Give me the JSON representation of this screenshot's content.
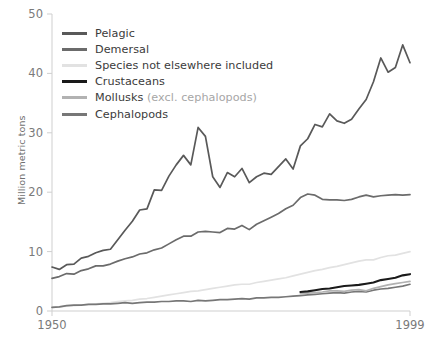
{
  "chart_data": {
    "type": "line",
    "title": "",
    "xlabel": "",
    "ylabel": "Million metric tons",
    "xlim": [
      1950,
      1999
    ],
    "ylim": [
      0,
      50
    ],
    "yticks": [
      0,
      10,
      20,
      30,
      40,
      50
    ],
    "xticks": [
      1950,
      1999
    ],
    "xtick_labels": [
      "1950",
      "1999"
    ],
    "ytick_labels": [
      "0",
      "10",
      "20",
      "30",
      "40",
      "50"
    ],
    "grid": false,
    "legend_position": "upper-left-inside",
    "x": [
      1950,
      1951,
      1952,
      1953,
      1954,
      1955,
      1956,
      1957,
      1958,
      1959,
      1960,
      1961,
      1962,
      1963,
      1964,
      1965,
      1966,
      1967,
      1968,
      1969,
      1970,
      1971,
      1972,
      1973,
      1974,
      1975,
      1976,
      1977,
      1978,
      1979,
      1980,
      1981,
      1982,
      1983,
      1984,
      1985,
      1986,
      1987,
      1988,
      1989,
      1990,
      1991,
      1992,
      1993,
      1994,
      1995,
      1996,
      1997,
      1998,
      1999
    ],
    "series": [
      {
        "name": "Pelagic",
        "color": "#595959",
        "values": [
          7.4,
          7.0,
          7.8,
          7.9,
          8.9,
          9.2,
          9.8,
          10.2,
          10.4,
          12.0,
          13.6,
          15.1,
          17.0,
          17.2,
          20.4,
          20.3,
          22.7,
          24.6,
          26.2,
          24.6,
          30.9,
          29.4,
          22.6,
          20.8,
          23.3,
          22.6,
          24.0,
          21.6,
          22.6,
          23.2,
          23.0,
          24.3,
          25.6,
          23.9,
          27.8,
          29.0,
          31.4,
          31.0,
          33.2,
          32.0,
          31.6,
          32.3,
          34.0,
          35.6,
          38.6,
          42.6,
          40.2,
          41.0,
          44.8,
          41.8
        ]
      },
      {
        "name": "Demersal",
        "color": "#6b6b6b",
        "values": [
          5.5,
          5.8,
          6.3,
          6.2,
          6.8,
          7.1,
          7.6,
          7.6,
          7.9,
          8.4,
          8.8,
          9.1,
          9.6,
          9.8,
          10.3,
          10.6,
          11.3,
          12.0,
          12.6,
          12.6,
          13.3,
          13.4,
          13.3,
          13.2,
          13.9,
          13.8,
          14.4,
          13.7,
          14.6,
          15.2,
          15.8,
          16.4,
          17.2,
          17.8,
          19.1,
          19.7,
          19.5,
          18.8,
          18.7,
          18.7,
          18.6,
          18.8,
          19.2,
          19.5,
          19.2,
          19.4,
          19.5,
          19.6,
          19.5,
          19.6
        ]
      },
      {
        "name": "Species not elsewhere included",
        "color": "#e2e2e2",
        "values": [
          0.6,
          0.7,
          0.8,
          0.9,
          1.0,
          1.1,
          1.2,
          1.3,
          1.4,
          1.6,
          1.7,
          1.8,
          2.0,
          2.1,
          2.3,
          2.5,
          2.7,
          2.9,
          3.1,
          3.3,
          3.4,
          3.6,
          3.8,
          4.0,
          4.2,
          4.4,
          4.5,
          4.5,
          4.8,
          5.0,
          5.2,
          5.4,
          5.6,
          5.9,
          6.2,
          6.5,
          6.8,
          7.0,
          7.3,
          7.5,
          7.8,
          8.1,
          8.4,
          8.6,
          8.6,
          9.0,
          9.3,
          9.4,
          9.7,
          10.0
        ]
      },
      {
        "name": "Crustaceans",
        "color": "#1a1a1a",
        "values": [
          null,
          null,
          null,
          null,
          null,
          null,
          null,
          null,
          null,
          null,
          null,
          null,
          null,
          null,
          null,
          null,
          null,
          null,
          null,
          null,
          null,
          null,
          null,
          null,
          null,
          null,
          null,
          null,
          null,
          null,
          null,
          null,
          null,
          null,
          3.2,
          3.3,
          3.5,
          3.7,
          3.8,
          4.0,
          4.2,
          4.3,
          4.4,
          4.6,
          4.8,
          5.2,
          5.4,
          5.6,
          6.0,
          6.2
        ]
      },
      {
        "name": "Mollusks (excl. cephalopods)",
        "color": "#b2b2b2",
        "values": [
          null,
          null,
          null,
          null,
          null,
          null,
          null,
          null,
          null,
          null,
          null,
          null,
          null,
          null,
          null,
          null,
          null,
          null,
          null,
          null,
          null,
          null,
          null,
          null,
          null,
          null,
          null,
          null,
          null,
          null,
          null,
          null,
          null,
          null,
          2.9,
          3.0,
          3.1,
          3.2,
          3.4,
          3.4,
          3.3,
          3.5,
          3.6,
          3.4,
          3.8,
          4.1,
          4.4,
          4.6,
          4.8,
          5.0
        ]
      },
      {
        "name": "Cephalopods",
        "color": "#777777",
        "values": [
          0.6,
          0.7,
          0.9,
          1.0,
          1.0,
          1.1,
          1.1,
          1.2,
          1.2,
          1.3,
          1.4,
          1.3,
          1.4,
          1.5,
          1.5,
          1.6,
          1.6,
          1.7,
          1.7,
          1.6,
          1.8,
          1.7,
          1.8,
          1.9,
          1.9,
          2.0,
          2.1,
          2.0,
          2.2,
          2.2,
          2.3,
          2.3,
          2.4,
          2.5,
          2.6,
          2.7,
          2.8,
          2.9,
          3.0,
          3.1,
          3.0,
          3.2,
          3.3,
          3.2,
          3.5,
          3.7,
          3.8,
          4.0,
          4.2,
          4.5
        ]
      }
    ]
  },
  "legend": {
    "items": [
      {
        "label": "Pelagic",
        "sub": "",
        "color": "#595959"
      },
      {
        "label": "Demersal",
        "sub": "",
        "color": "#6b6b6b"
      },
      {
        "label": "Species not elsewhere included",
        "sub": "",
        "color": "#e2e2e2"
      },
      {
        "label": "Crustaceans",
        "sub": "",
        "color": "#1a1a1a"
      },
      {
        "label": "Mollusks ",
        "sub": "(excl. cephalopods)",
        "color": "#b2b2b2"
      },
      {
        "label": "Cephalopods",
        "sub": "",
        "color": "#777777"
      }
    ]
  },
  "axes": {
    "y_title": "Million metric tons",
    "axis_color": "#cfcfcf",
    "tick_text_color": "#7a7a7a"
  }
}
